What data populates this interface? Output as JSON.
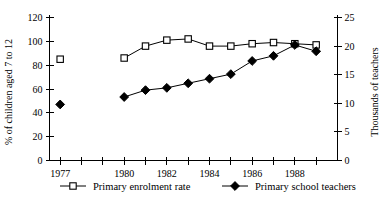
{
  "chart_data": {
    "type": "line",
    "title": "",
    "xlabel": "",
    "ylabel": "% of children aged 7 to 12",
    "y2label": "Thousands of teachers",
    "grid": false,
    "legend_position": "bottom",
    "x": [
      1977,
      1980,
      1981,
      1982,
      1983,
      1984,
      1985,
      1986,
      1987,
      1988,
      1989
    ],
    "xlim": [
      1976.5,
      1990.0
    ],
    "xticks": [
      1977,
      1978,
      1979,
      1980,
      1981,
      1982,
      1983,
      1984,
      1985,
      1986,
      1987,
      1988,
      1989
    ],
    "xticklabels": [
      "1977",
      "",
      "",
      "1980",
      "",
      "1982",
      "",
      "1984",
      "",
      "1986",
      "",
      "1988",
      ""
    ],
    "ylim": [
      0,
      120
    ],
    "yticks": [
      0,
      20,
      40,
      60,
      80,
      100,
      120
    ],
    "yticklabels": [
      "0",
      "20",
      "40",
      "60",
      "80",
      "100",
      "120"
    ],
    "y2lim": [
      0,
      25
    ],
    "y2ticks": [
      0,
      5,
      10,
      15,
      20,
      25
    ],
    "y2ticklabels": [
      "0",
      "5",
      "10",
      "15",
      "20",
      "25"
    ],
    "series": [
      {
        "name": "Primary enrolment rate",
        "axis": "left",
        "marker": "open-square",
        "connected_from": 1980,
        "points": [
          {
            "x": 1977,
            "y": 85
          },
          {
            "x": 1980,
            "y": 86
          },
          {
            "x": 1981,
            "y": 96
          },
          {
            "x": 1982,
            "y": 101
          },
          {
            "x": 1983,
            "y": 102
          },
          {
            "x": 1984,
            "y": 96
          },
          {
            "x": 1985,
            "y": 96
          },
          {
            "x": 1986,
            "y": 98
          },
          {
            "x": 1987,
            "y": 99
          },
          {
            "x": 1988,
            "y": 98
          },
          {
            "x": 1989,
            "y": 97
          }
        ]
      },
      {
        "name": "Primary school teachers",
        "axis": "right",
        "marker": "filled-diamond",
        "connected_from": 1980,
        "points": [
          {
            "x": 1977,
            "y": 9.8
          },
          {
            "x": 1980,
            "y": 11.1
          },
          {
            "x": 1981,
            "y": 12.3
          },
          {
            "x": 1982,
            "y": 12.7
          },
          {
            "x": 1983,
            "y": 13.5
          },
          {
            "x": 1984,
            "y": 14.3
          },
          {
            "x": 1985,
            "y": 15.1
          },
          {
            "x": 1986,
            "y": 17.4
          },
          {
            "x": 1987,
            "y": 18.3
          },
          {
            "x": 1988,
            "y": 20.2
          },
          {
            "x": 1989,
            "y": 19.1
          }
        ]
      }
    ]
  },
  "legend": {
    "entries": [
      {
        "label": "Primary enrolment rate",
        "marker": "open-square"
      },
      {
        "label": "Primary school teachers",
        "marker": "filled-diamond"
      }
    ]
  },
  "axes": {
    "left_title": "% of children aged 7 to 12",
    "right_title": "Thousands of teachers"
  }
}
